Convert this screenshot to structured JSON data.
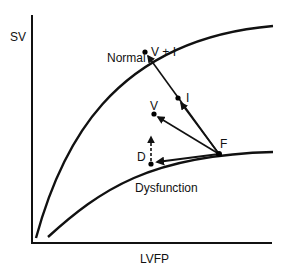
{
  "axes": {
    "y_label": "SV",
    "x_label": "LVFP"
  },
  "curves": {
    "normal": {
      "label": "Normal"
    },
    "dysfunction": {
      "label": "Dysfunction"
    }
  },
  "points": {
    "f": {
      "label": "F"
    },
    "v_plus_i": {
      "label": "V + I"
    },
    "v": {
      "label": "V"
    },
    "i": {
      "label": "I"
    },
    "d": {
      "label": "D"
    }
  },
  "colors": {
    "ink": "#111111",
    "background": "#ffffff"
  }
}
